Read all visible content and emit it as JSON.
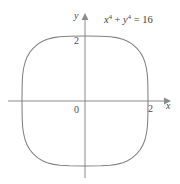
{
  "figure": {
    "title": "",
    "background_color": "#ffffff",
    "width": 180,
    "height": 184
  },
  "labels": {
    "x_axis_name": "x",
    "y_axis_name": "y",
    "origin": "0",
    "x_tick": "2",
    "y_tick": "2"
  },
  "equation": {
    "x_var": "x",
    "x_exponent": "4",
    "plus": " + ",
    "y_var": "y",
    "y_exponent": "4",
    "equals": " = ",
    "constant": "16",
    "full_text": "x⁴ + y⁴ = 16"
  },
  "colors": {
    "curve": "#808080",
    "axis": "#8a8a8a",
    "text": "#4a4a4a"
  },
  "chart_data": {
    "type": "line",
    "title": "",
    "subtitle": "",
    "xlabel": "x",
    "ylabel": "y",
    "curve_equation": "x^4 + y^4 = 16",
    "curve_name": "squircle x⁴ + y⁴ = 16",
    "xlim": [
      -2.45,
      2.45
    ],
    "ylim": [
      -2.55,
      2.55
    ],
    "grid": false,
    "legend": "none",
    "annotations": [
      {
        "text": "x⁴ + y⁴ = 16",
        "x": 1.1,
        "y": 2.35
      }
    ],
    "xticks": [
      2
    ],
    "xtick_labels": [
      "2"
    ],
    "yticks": [
      2
    ],
    "ytick_labels": [
      "2"
    ],
    "origin_label": "0",
    "axis_arrows": [
      "x-positive",
      "y-positive"
    ],
    "intercepts": {
      "x": [
        -2,
        2
      ],
      "y": [
        -2,
        2
      ]
    },
    "points": [
      [
        2.0,
        0.0
      ],
      [
        1.995,
        0.5
      ],
      [
        1.98,
        0.8
      ],
      [
        1.95,
        1.0
      ],
      [
        1.9,
        1.2
      ],
      [
        1.84,
        1.35
      ],
      [
        1.75,
        1.5
      ],
      [
        1.65,
        1.62
      ],
      [
        1.5,
        1.75
      ],
      [
        1.35,
        1.84
      ],
      [
        1.2,
        1.9
      ],
      [
        1.0,
        1.95
      ],
      [
        0.8,
        1.98
      ],
      [
        0.5,
        1.995
      ],
      [
        0.0,
        2.0
      ],
      [
        -0.5,
        1.995
      ],
      [
        -0.8,
        1.98
      ],
      [
        -1.0,
        1.95
      ],
      [
        -1.2,
        1.9
      ],
      [
        -1.35,
        1.84
      ],
      [
        -1.5,
        1.75
      ],
      [
        -1.65,
        1.62
      ],
      [
        -1.75,
        1.5
      ],
      [
        -1.84,
        1.35
      ],
      [
        -1.9,
        1.2
      ],
      [
        -1.95,
        1.0
      ],
      [
        -1.98,
        0.8
      ],
      [
        -1.995,
        0.5
      ],
      [
        -2.0,
        0.0
      ],
      [
        -1.995,
        -0.5
      ],
      [
        -1.98,
        -0.8
      ],
      [
        -1.95,
        -1.0
      ],
      [
        -1.9,
        -1.2
      ],
      [
        -1.84,
        -1.35
      ],
      [
        -1.75,
        -1.5
      ],
      [
        -1.65,
        -1.62
      ],
      [
        -1.5,
        -1.75
      ],
      [
        -1.35,
        -1.84
      ],
      [
        -1.2,
        -1.9
      ],
      [
        -1.0,
        -1.95
      ],
      [
        -0.8,
        -1.98
      ],
      [
        -0.5,
        -1.995
      ],
      [
        0.0,
        -2.0
      ],
      [
        0.5,
        -1.995
      ],
      [
        0.8,
        -1.98
      ],
      [
        1.0,
        -1.95
      ],
      [
        1.2,
        -1.9
      ],
      [
        1.35,
        -1.84
      ],
      [
        1.5,
        -1.75
      ],
      [
        1.65,
        -1.62
      ],
      [
        1.75,
        -1.5
      ],
      [
        1.84,
        -1.35
      ],
      [
        1.9,
        -1.2
      ],
      [
        1.95,
        -1.0
      ],
      [
        1.98,
        -0.8
      ],
      [
        1.995,
        -0.5
      ],
      [
        2.0,
        0.0
      ]
    ]
  }
}
